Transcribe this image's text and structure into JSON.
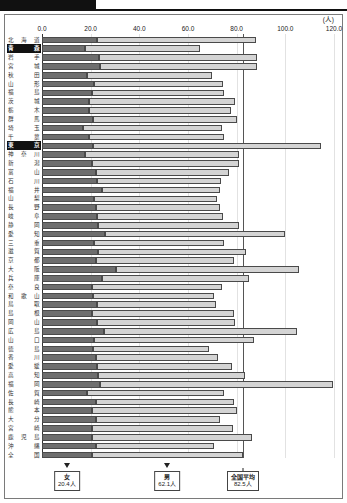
{
  "unit_label": "(人)",
  "axis": {
    "ticks": [
      "0.0",
      "20.0",
      "40.0",
      "60.0",
      "80.0",
      "100.0",
      "120.0"
    ],
    "tick_values": [
      0,
      20,
      40,
      60,
      80,
      100,
      120
    ],
    "min": 0,
    "max": 120
  },
  "legend": {
    "female": {
      "name": "女",
      "value": "20.4人",
      "value_num": 20.4
    },
    "male": {
      "name": "男",
      "value": "62.1人",
      "value_num": 62.1
    },
    "national_average": {
      "name": "全国平均",
      "value": "82.5人",
      "value_num": 82.5
    }
  },
  "colors": {
    "female_bar": "#6e6e6e",
    "male_bar": "#d4d4d4",
    "bar_border": "#4a4a4a",
    "highlight_bg": "#111111",
    "highlight_fg": "#ffffff",
    "reference_line": "#555555",
    "gridline": "#e2e2e2",
    "frame": "#7a7a7a"
  },
  "chart_data": {
    "type": "bar",
    "title": "",
    "xlabel": "(人)",
    "ylabel": "",
    "xlim": [
      0,
      120
    ],
    "grid": true,
    "orientation": "horizontal",
    "stacked": true,
    "legend_position": "bottom",
    "reference_line": {
      "label": "全国平均",
      "value": 82.5
    },
    "series": [
      {
        "name": "女",
        "color": "#6e6e6e",
        "values": [
          22.5,
          17.5,
          23.5,
          24.0,
          18.5,
          21.5,
          20.5,
          19.5,
          19.5,
          21.0,
          17.0,
          19.5,
          21.0,
          17.5,
          20.5,
          22.0,
          22.5,
          24.5,
          21.5,
          22.0,
          22.5,
          23.0,
          26.0,
          21.5,
          23.0,
          22.0,
          30.5,
          24.5,
          20.5,
          21.0,
          22.5,
          20.5,
          22.5,
          25.5,
          21.5,
          21.0,
          22.0,
          22.5,
          23.0,
          24.0,
          18.5,
          22.0,
          20.5,
          22.0,
          20.5,
          20.5,
          22.0,
          20.4
        ]
      },
      {
        "name": "男",
        "color": "#d4d4d4",
        "values": [
          65.5,
          47.5,
          65.0,
          64.5,
          51.5,
          53.0,
          54.5,
          60.0,
          58.0,
          59.0,
          57.0,
          55.5,
          93.5,
          63.5,
          60.5,
          55.0,
          51.0,
          48.5,
          50.5,
          51.0,
          52.0,
          58.0,
          74.0,
          53.5,
          61.0,
          57.0,
          75.0,
          60.5,
          53.5,
          49.5,
          49.0,
          58.5,
          57.0,
          79.5,
          65.5,
          47.5,
          50.5,
          55.5,
          60.5,
          95.5,
          56.5,
          57.0,
          59.5,
          51.0,
          58.0,
          66.0,
          48.5,
          62.1
        ]
      }
    ],
    "categories": [
      "北海道",
      "青　森",
      "岩　手",
      "宮　城",
      "秋　田",
      "山　形",
      "福　島",
      "茨　城",
      "栃　木",
      "群　馬",
      "埼　玉",
      "千　葉",
      "東　京",
      "神奈川",
      "新　潟",
      "富　山",
      "石　川",
      "福　井",
      "山　梨",
      "長　野",
      "岐　阜",
      "静　岡",
      "愛　知",
      "三　重",
      "滋　賀",
      "京　都",
      "大　阪",
      "兵　庫",
      "奈　良",
      "和歌山",
      "鳥　取",
      "島　根",
      "岡　山",
      "広　島",
      "山　口",
      "徳　島",
      "香　川",
      "愛　媛",
      "高　知",
      "福　岡",
      "佐　賀",
      "長　崎",
      "熊　本",
      "大　分",
      "宮　崎",
      "鹿児島",
      "沖　縄",
      "全　国"
    ],
    "highlighted_categories": [
      "青　森",
      "東　京"
    ]
  }
}
